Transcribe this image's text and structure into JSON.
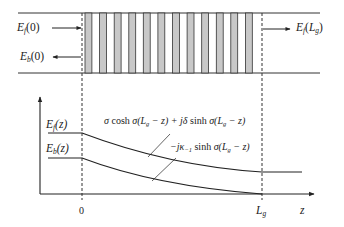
{
  "diagram": {
    "type": "bragg-grating-field-distribution",
    "waveguide": {
      "labels": {
        "ef0": {
          "sym": "E",
          "sub": "f",
          "arg": "(0)"
        },
        "eb0": {
          "sym": "E",
          "sub": "b",
          "arg": "(0)"
        },
        "efL": {
          "sym": "E",
          "sub": "f",
          "arg_open": "(",
          "arg_sym": "L",
          "arg_sub": "g",
          "arg_close": ")"
        }
      },
      "grating_periods": 12,
      "colors": {
        "stripe": "#c8c8c8",
        "line": "#333333"
      }
    },
    "plot": {
      "y_labels": {
        "ef": {
          "sym": "E",
          "sub": "f",
          "arg": "(z)"
        },
        "eb": {
          "sym": "E",
          "sub": "b",
          "arg": "(z)"
        }
      },
      "annotations": {
        "forward": "σ cosh σ(L_g − z) + jδ sinh σ(L_g − z)",
        "backward": "−jκ_{−1} sinh σ(L_g − z)"
      },
      "x_ticks": {
        "zero": "0",
        "lg_sym": "L",
        "lg_sub": "g",
        "axis": "z"
      }
    }
  }
}
